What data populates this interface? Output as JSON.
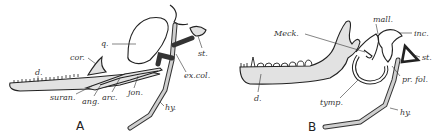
{
  "figure": {
    "panels": [
      {
        "id": "A",
        "label": "A",
        "labels": {
          "d": "d.",
          "cor": "cor.",
          "q": "q.",
          "st": "st.",
          "ex_col": "ex.col.",
          "jon": "jon.",
          "arc": "arc.",
          "ang": "ang.",
          "suran": "suran.",
          "hy": "hy."
        }
      },
      {
        "id": "B",
        "label": "B",
        "labels": {
          "meck": "Meck.",
          "mall": "mall.",
          "inc": "inc.",
          "st": "st.",
          "pr_fol": "pr. fol.",
          "d": "d.",
          "tymp": "tymp.",
          "hy": "hy."
        }
      }
    ],
    "colors": {
      "line": "#222222",
      "bone_fill": "#e2e2e2",
      "background": "#ffffff"
    }
  }
}
